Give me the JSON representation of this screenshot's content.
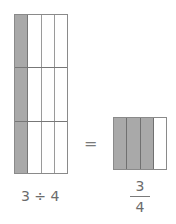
{
  "diagram": {
    "left_model": {
      "columns": 4,
      "rows": 3,
      "shaded_columns": 1,
      "caption": "3 ÷ 4"
    },
    "equals": "=",
    "right_model": {
      "columns": 4,
      "rows": 1,
      "shaded_columns": 3,
      "fraction": {
        "numerator": "3",
        "denominator": "4"
      }
    },
    "colors": {
      "shade": "#a9a9a9",
      "line": "#8a8a8a",
      "text": "#6b6b6b"
    }
  }
}
